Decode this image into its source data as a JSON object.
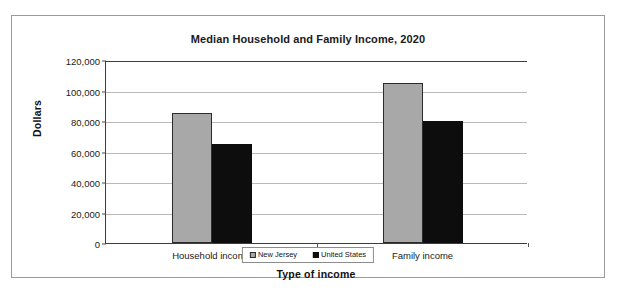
{
  "chart_data": {
    "type": "bar",
    "title": "Median Household and Family Income, 2020",
    "xlabel": "Type of income",
    "ylabel": "Dollars",
    "categories": [
      "Household income",
      "Family income"
    ],
    "series": [
      {
        "name": "New Jersey",
        "color": "#a8a8a8",
        "values": [
          85000,
          105000
        ]
      },
      {
        "name": "United States",
        "color": "#0d0d0d",
        "values": [
          65000,
          80000
        ]
      }
    ],
    "ylim": [
      0,
      120000
    ],
    "ytick_values": [
      0,
      20000,
      40000,
      60000,
      80000,
      100000,
      120000
    ],
    "ytick_labels": [
      "0",
      "20,000",
      "40,000",
      "60,000",
      "80,000",
      "100,000",
      "120,000"
    ],
    "grid": true,
    "legend_position": "bottom"
  },
  "legend": {
    "entries": [
      {
        "label": "New Jersey"
      },
      {
        "label": "United States"
      }
    ]
  }
}
